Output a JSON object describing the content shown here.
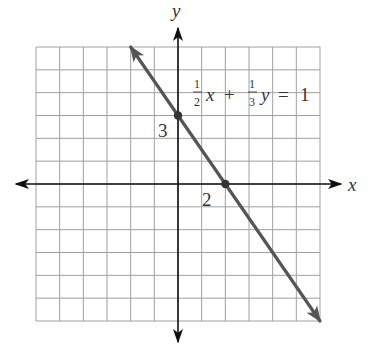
{
  "chart_data": {
    "type": "line",
    "title": "",
    "xlabel": "x",
    "ylabel": "y",
    "xlim": [
      -6,
      6
    ],
    "ylim": [
      -6,
      6
    ],
    "grid": true,
    "grid_step": 1,
    "series": [
      {
        "name": "1/2 x + 1/3 y = 1",
        "equation": "(1/2)x + (1/3)y = 1",
        "slope": -1.5,
        "intercept": 3,
        "x": [
          -2,
          6
        ],
        "y": [
          6,
          -6
        ],
        "arrows_both_ends": true
      }
    ],
    "points": [
      {
        "x": 0,
        "y": 3,
        "label": "3"
      },
      {
        "x": 2,
        "y": 0,
        "label": "2"
      }
    ],
    "annotations": [
      {
        "text": "1/2 x + 1/3 y = 1",
        "position": "upper right of y-axis"
      }
    ]
  },
  "labels": {
    "x_axis": "x",
    "y_axis": "y",
    "y_intercept": "3",
    "x_intercept": "2",
    "eq_frac1_num": "1",
    "eq_frac1_den": "2",
    "eq_x": "x",
    "eq_plus": "+",
    "eq_frac2_num": "1",
    "eq_frac2_den": "3",
    "eq_y": "y",
    "eq_equals": "=",
    "eq_rhs": "1"
  },
  "colors": {
    "grid": "#a0a0a0",
    "axis": "#111111",
    "line": "#555555",
    "point": "#333333"
  }
}
